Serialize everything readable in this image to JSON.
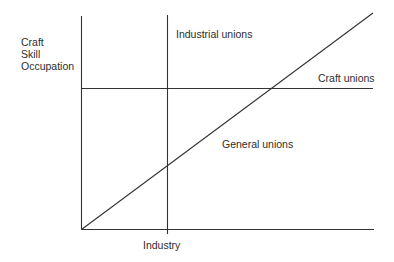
{
  "diagram": {
    "y_axis_label_lines": [
      "Craft",
      "Skill",
      "Occupation"
    ],
    "x_axis_label": "Industry",
    "regions": {
      "industrial": "Industrial unions",
      "craft": "Craft unions",
      "general": "General unions"
    },
    "line_color": "#333333",
    "text_color": "#2e2e2e"
  }
}
